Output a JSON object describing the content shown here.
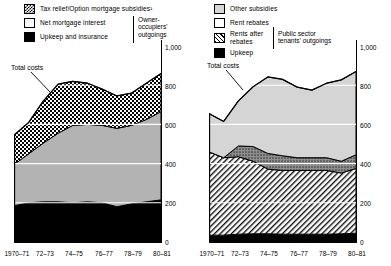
{
  "figure": {
    "title": "",
    "panels": [
      {
        "id": "owner-occupiers",
        "group_label": "Owner-\noccupiers'\noutgoings",
        "callout": "Total costs",
        "legend": [
          {
            "label": "Tax relief/Option mortgage subsidies¹",
            "swatch": "checker"
          },
          {
            "label": "Net mortgage interest",
            "swatch": "white"
          },
          {
            "label": "Upkeep and insurance",
            "swatch": "black"
          }
        ],
        "yticks": [
          "0",
          "200",
          "400",
          "600",
          "800",
          "1,000"
        ],
        "xticks": [
          "1970–71",
          "72–73",
          "74–75",
          "76–77",
          "78–79",
          "80–81"
        ]
      },
      {
        "id": "public-sector-tenants",
        "group_label": "Public sector\ntenants' outgoings",
        "callout": "Total costs",
        "legend": [
          {
            "label": "Other subsidies",
            "swatch": "lightgrey"
          },
          {
            "label": "Rent rebates",
            "swatch": "dots"
          },
          {
            "label": "Rents after\nrebates",
            "swatch": "diagonal"
          },
          {
            "label": "Upkeep",
            "swatch": "black"
          }
        ],
        "yticks": [
          "0",
          "200",
          "400",
          "600",
          "800",
          "1,000"
        ],
        "xticks": [
          "1970–71",
          "72–73",
          "74–75",
          "76–77",
          "78–79",
          "80–81"
        ]
      }
    ]
  },
  "chart_data": [
    {
      "type": "area",
      "id": "owner-occupiers",
      "title": "Owner-occupiers' outgoings",
      "xlabel": "",
      "ylabel": "",
      "ylim": [
        0,
        1000
      ],
      "grid": true,
      "legend_position": "top-left",
      "x": [
        "1970-71",
        "1971-72",
        "1972-73",
        "1973-74",
        "1974-75",
        "1975-76",
        "1976-77",
        "1977-78",
        "1978-79",
        "1979-80",
        "1980-81"
      ],
      "tick_labels": [
        "1970–71",
        "72–73",
        "74–75",
        "76–77",
        "78–79",
        "80–81"
      ],
      "stacked": true,
      "series": [
        {
          "name": "Upkeep and insurance",
          "swatch": "black",
          "values": [
            185,
            200,
            205,
            205,
            200,
            205,
            200,
            180,
            195,
            205,
            215
          ]
        },
        {
          "name": "Net mortgage interest",
          "swatch": "white",
          "values": [
            210,
            250,
            300,
            350,
            395,
            395,
            395,
            400,
            400,
            420,
            450
          ]
        },
        {
          "name": "Tax relief/Option mortgage subsidies¹",
          "swatch": "checker",
          "values": [
            150,
            160,
            215,
            250,
            225,
            210,
            185,
            165,
            165,
            185,
            195
          ]
        }
      ],
      "total_line": {
        "name": "Total costs",
        "values": [
          545,
          610,
          720,
          805,
          820,
          810,
          780,
          745,
          760,
          810,
          860
        ]
      }
    },
    {
      "type": "area",
      "id": "public-sector-tenants",
      "title": "Public sector tenants' outgoings",
      "xlabel": "",
      "ylabel": "",
      "ylim": [
        0,
        1000
      ],
      "grid": true,
      "legend_position": "top-left",
      "x": [
        "1970-71",
        "1971-72",
        "1972-73",
        "1973-74",
        "1974-75",
        "1975-76",
        "1976-77",
        "1977-78",
        "1978-79",
        "1979-80",
        "1980-81"
      ],
      "tick_labels": [
        "1970–71",
        "72–73",
        "74–75",
        "76–77",
        "78–79",
        "80–81"
      ],
      "stacked": true,
      "series": [
        {
          "name": "Upkeep",
          "swatch": "black",
          "values": [
            35,
            35,
            40,
            42,
            42,
            40,
            40,
            40,
            40,
            42,
            45
          ]
        },
        {
          "name": "Rents after rebates",
          "swatch": "diagonal",
          "values": [
            425,
            395,
            395,
            370,
            330,
            325,
            325,
            325,
            325,
            310,
            330
          ]
        },
        {
          "name": "Rent rebates",
          "swatch": "dots",
          "values": [
            0,
            0,
            55,
            75,
            80,
            75,
            65,
            65,
            65,
            60,
            70
          ]
        },
        {
          "name": "Other subsidies",
          "swatch": "lightgrey",
          "values": [
            195,
            185,
            230,
            305,
            390,
            390,
            360,
            345,
            380,
            415,
            425
          ]
        }
      ],
      "total_line": {
        "name": "Total costs",
        "values": [
          655,
          615,
          720,
          792,
          842,
          830,
          790,
          775,
          810,
          827,
          870
        ]
      }
    }
  ]
}
